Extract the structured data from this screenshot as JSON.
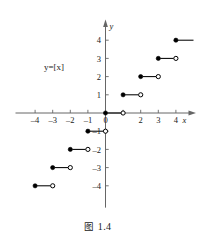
{
  "figure": {
    "caption_prefix": "图",
    "caption_number": "1.4",
    "curve_label": "y=[x]"
  },
  "axes": {
    "x_axis_name": "x",
    "y_axis_name": "y",
    "x_ticks": [
      {
        "value": -4,
        "label": "–4"
      },
      {
        "value": -3,
        "label": "–3"
      },
      {
        "value": -2,
        "label": "–2"
      },
      {
        "value": -1,
        "label": "–1"
      },
      {
        "value": 0,
        "label": "0"
      },
      {
        "value": 2,
        "label": "2"
      },
      {
        "value": 3,
        "label": "3"
      },
      {
        "value": 4,
        "label": "4"
      }
    ],
    "y_ticks": [
      {
        "value": 4,
        "label": "4"
      },
      {
        "value": 3,
        "label": "3"
      },
      {
        "value": 2,
        "label": "2"
      },
      {
        "value": 1,
        "label": "1"
      },
      {
        "value": -1,
        "label": "–1"
      },
      {
        "value": -2,
        "label": "–2"
      },
      {
        "value": -3,
        "label": "–3"
      },
      {
        "value": -4,
        "label": "–4"
      }
    ],
    "x_range": [
      -5.0,
      5.0
    ],
    "y_range": [
      -5.2,
      5.0
    ],
    "axis_color": "#666666",
    "curve_color": "#000000"
  },
  "chart_data": {
    "type": "line",
    "subtitle": "y=[x]",
    "xlabel": "x",
    "ylabel": "y",
    "xlim": [
      -5.0,
      5.0
    ],
    "ylim": [
      -5.2,
      5.0
    ],
    "grid": false,
    "legend": "none",
    "function": "y = [x] (greatest integer / floor function)",
    "annotations": [
      "y=[x]"
    ],
    "marker_legend": {
      "filled_circle": "endpoint included",
      "open_circle": "endpoint excluded"
    },
    "series": [
      {
        "name": "floor step segments",
        "segments": [
          {
            "x_start": -4,
            "x_end": -3,
            "y": -4,
            "start_marker": "filled",
            "end_marker": "open",
            "clipped_left": false,
            "clipped_right": false
          },
          {
            "x_start": -3,
            "x_end": -2,
            "y": -3,
            "start_marker": "filled",
            "end_marker": "open",
            "clipped_left": false,
            "clipped_right": false
          },
          {
            "x_start": -2,
            "x_end": -1,
            "y": -2,
            "start_marker": "filled",
            "end_marker": "open",
            "clipped_left": false,
            "clipped_right": false
          },
          {
            "x_start": -1,
            "x_end": 0,
            "y": -1,
            "start_marker": "filled",
            "end_marker": "open",
            "clipped_left": false,
            "clipped_right": false
          },
          {
            "x_start": 0,
            "x_end": 1,
            "y": 0,
            "start_marker": "filled",
            "end_marker": "open",
            "clipped_left": false,
            "clipped_right": false
          },
          {
            "x_start": 1,
            "x_end": 2,
            "y": 1,
            "start_marker": "filled",
            "end_marker": "open",
            "clipped_left": false,
            "clipped_right": false
          },
          {
            "x_start": 2,
            "x_end": 3,
            "y": 2,
            "start_marker": "filled",
            "end_marker": "open",
            "clipped_left": false,
            "clipped_right": false
          },
          {
            "x_start": 3,
            "x_end": 4,
            "y": 3,
            "start_marker": "filled",
            "end_marker": "open",
            "clipped_left": false,
            "clipped_right": false
          },
          {
            "x_start": 4,
            "x_end": 5,
            "y": 4,
            "start_marker": "filled",
            "end_marker": "none",
            "clipped_left": false,
            "clipped_right": true
          }
        ]
      }
    ]
  }
}
